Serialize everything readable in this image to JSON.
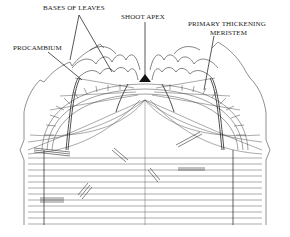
{
  "labels": {
    "bases_of_leaves": "BASES OF LEAVES",
    "shoot_apex": "SHOOT APEX",
    "primary_thickening_line1": "PRIMARY THICKENING",
    "primary_thickening_line2": "MERISTEM",
    "procambium": "PROCAMBIUM"
  },
  "colors": {
    "ink": "#333333",
    "background": "#ffffff"
  }
}
